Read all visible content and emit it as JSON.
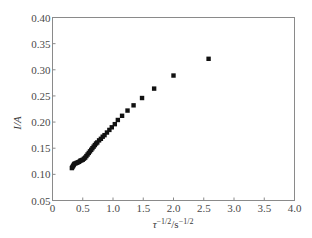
{
  "chart_data": {
    "type": "scatter",
    "title": "",
    "xlabel": "τ^-1/2/s^-1/2",
    "ylabel": "I/A",
    "xlabel_parts": {
      "base": "τ",
      "sup1": "−1/2",
      "mid": "/s",
      "sup2": "−1/2"
    },
    "ylabel_text": "I/A",
    "xlim": [
      0,
      4.0
    ],
    "ylim": [
      0.05,
      0.4
    ],
    "xticks": [
      0,
      0.5,
      1.0,
      1.5,
      2.0,
      2.5,
      3.0,
      3.5,
      4.0
    ],
    "xtick_labels": [
      "0",
      "0.5",
      "1.0",
      "1.5",
      "2.0",
      "2.5",
      "3.0",
      "3.5",
      "4.0"
    ],
    "yticks": [
      0.05,
      0.1,
      0.15,
      0.2,
      0.25,
      0.3,
      0.35,
      0.4
    ],
    "ytick_labels": [
      "0.05",
      "0.10",
      "0.15",
      "0.20",
      "0.25",
      "0.30",
      "0.35",
      "0.40"
    ],
    "grid": false,
    "legend": null,
    "marker": "square",
    "marker_color": "#111111",
    "series": [
      {
        "name": "I vs τ^-1/2",
        "x": [
          0.32,
          0.33,
          0.34,
          0.35,
          0.36,
          0.38,
          0.4,
          0.42,
          0.44,
          0.46,
          0.48,
          0.5,
          0.52,
          0.54,
          0.56,
          0.58,
          0.6,
          0.62,
          0.64,
          0.66,
          0.68,
          0.7,
          0.72,
          0.74,
          0.77,
          0.8,
          0.83,
          0.86,
          0.9,
          0.94,
          0.98,
          1.03,
          1.08,
          1.15,
          1.24,
          1.34,
          1.48,
          1.68,
          2.0,
          2.58
        ],
        "y": [
          0.112,
          0.114,
          0.116,
          0.118,
          0.12,
          0.121,
          0.122,
          0.123,
          0.124,
          0.126,
          0.127,
          0.128,
          0.13,
          0.132,
          0.135,
          0.138,
          0.141,
          0.144,
          0.147,
          0.15,
          0.153,
          0.156,
          0.159,
          0.161,
          0.165,
          0.168,
          0.172,
          0.175,
          0.18,
          0.185,
          0.19,
          0.196,
          0.204,
          0.212,
          0.222,
          0.232,
          0.246,
          0.264,
          0.289,
          0.321
        ]
      }
    ]
  },
  "plot_area": {
    "left": 52.5,
    "top": 17.5,
    "right": 294.5,
    "bottom": 200.5
  },
  "colors": {
    "axis": "#8a8a8a",
    "marker": "#111111",
    "text": "#4a4a4a"
  }
}
